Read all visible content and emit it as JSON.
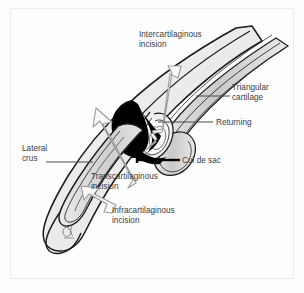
{
  "figure": {
    "type": "medical-anatomical-illustration",
    "background_color": "#fdfdfd",
    "frame_color": "#ececed",
    "text_color": "#3b3b3d",
    "cartilage_fill": "#d8d8d8",
    "soft_tissue_fill": "#ededed",
    "cul_de_sac_fill": "#000000",
    "arrow_fill": "#fbfbfb",
    "arrow_outline": "#9a9a9a",
    "outline_color": "#1a1a1a"
  },
  "labels": {
    "intercartilaginous": "Intercartilaginous\nincision",
    "triangular_cartilage": "Triangular\ncartilage",
    "returning": "Returning",
    "lateral_crus": "Lateral\ncrus",
    "cul_de_sac": "Cul de sac",
    "transcartilaginous": "Transcartilaginous\nincision",
    "infracartilaginous": "Infracartilaginous\nincision"
  },
  "annotations": {
    "artist_signature": "monogram"
  }
}
